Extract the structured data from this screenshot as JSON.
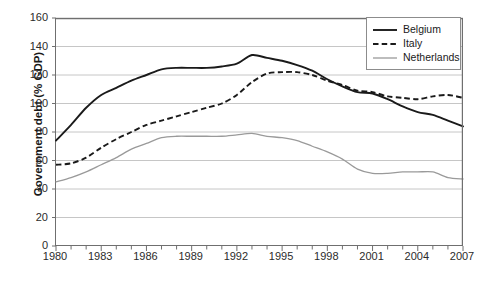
{
  "chart_data": {
    "type": "line",
    "title": "",
    "xlabel": "",
    "ylabel": "Government debt (% GDP)",
    "ylim": [
      0,
      160
    ],
    "xlim": [
      1980,
      2007
    ],
    "ytick_step": 20,
    "yticks": [
      "0",
      "20",
      "40",
      "60",
      "80",
      "100",
      "120",
      "140",
      "160"
    ],
    "xticks": [
      "1980",
      "1983",
      "1986",
      "1989",
      "1992",
      "1995",
      "1998",
      "2001",
      "2004",
      "2007"
    ],
    "xtick_step": 3,
    "x_minor_ticks_every": 1,
    "grid": "horizontal",
    "legend_position": "top-right",
    "x": [
      1980,
      1981,
      1982,
      1983,
      1984,
      1985,
      1986,
      1987,
      1988,
      1989,
      1990,
      1991,
      1992,
      1993,
      1994,
      1995,
      1996,
      1997,
      1998,
      1999,
      2000,
      2001,
      2002,
      2003,
      2004,
      2005,
      2006,
      2007
    ],
    "series": [
      {
        "name": "Belgium",
        "color": "#1a1a1a",
        "style": "solid",
        "values": [
          74,
          85,
          97,
          106,
          111,
          116,
          120,
          124,
          125,
          125,
          125,
          126,
          128,
          134,
          132,
          130,
          127,
          123,
          117,
          112,
          108,
          107,
          103,
          98,
          94,
          92,
          88,
          84
        ]
      },
      {
        "name": "Italy",
        "color": "#1a1a1a",
        "style": "dashed",
        "values": [
          57,
          58,
          62,
          69,
          75,
          80,
          85,
          88,
          91,
          94,
          97,
          100,
          106,
          115,
          121,
          122,
          122,
          120,
          116,
          113,
          109,
          108,
          105,
          104,
          103,
          105,
          106,
          104
        ]
      },
      {
        "name": "Netherlands",
        "color": "#9a9a9a",
        "style": "solid",
        "values": [
          45,
          48,
          52,
          57,
          62,
          68,
          72,
          76,
          77,
          77,
          77,
          77,
          78,
          79,
          77,
          76,
          74,
          70,
          66,
          61,
          54,
          51,
          51,
          52,
          52,
          52,
          48,
          47
        ]
      }
    ]
  },
  "legend": {
    "items": [
      {
        "label": "Belgium",
        "swatch": "solid-black-line"
      },
      {
        "label": "Italy",
        "swatch": "dashed-black-line"
      },
      {
        "label": "Netherlands",
        "swatch": "solid-gray-line"
      }
    ]
  }
}
